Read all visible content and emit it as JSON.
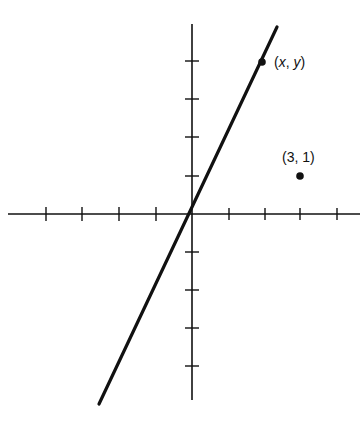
{
  "diagram": {
    "type": "coordinate-plane",
    "colors": {
      "background": "#ffffff",
      "ink": "#111111"
    },
    "axes": {
      "origin_px": [
        192,
        214
      ],
      "x_unit_px": 36.5,
      "y_unit_px": 38,
      "x_range": [
        -5,
        4.5
      ],
      "y_range": [
        -5,
        5
      ],
      "x_ticks": [
        -4,
        -3,
        -2,
        -1,
        1,
        2,
        3,
        4
      ],
      "y_ticks": [
        -4,
        -3,
        -2,
        -1,
        1,
        2,
        3,
        4
      ]
    },
    "line": {
      "description": "line through origin and (x, y)",
      "slope": 2,
      "from": [
        -2.55,
        -5.1
      ],
      "to": [
        2.3,
        4.9
      ]
    },
    "points": [
      {
        "label": "(x, y)",
        "label_x": "x",
        "label_y": "y",
        "coords": [
          2,
          4
        ]
      },
      {
        "label": "(3, 1)",
        "coords": [
          3,
          1
        ]
      }
    ]
  }
}
